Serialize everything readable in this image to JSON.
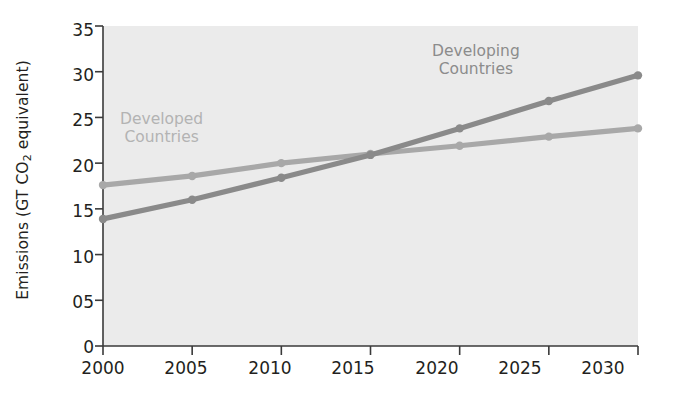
{
  "chart_data": {
    "type": "line",
    "title": "",
    "xlabel": "",
    "ylabel": "Emissions (GT CO2 equivalent)",
    "ylabel_prefix": "Emissions (GT CO",
    "ylabel_sub": "2",
    "ylabel_suffix": " equivalent)",
    "x": [
      2000,
      2005,
      2010,
      2015,
      2020,
      2025,
      2030
    ],
    "categories": [
      "2000",
      "2005",
      "2010",
      "2015",
      "2020",
      "2025",
      "2030"
    ],
    "xlim": [
      2000,
      2030
    ],
    "ylim": [
      0,
      35
    ],
    "yticks": [
      35,
      30,
      25,
      20,
      15,
      10,
      5,
      0
    ],
    "ytick_labels": [
      "35",
      "30",
      "25",
      "20",
      "15",
      "10",
      "05",
      "0"
    ],
    "grid": false,
    "legend_position": "inline-annotations",
    "series": [
      {
        "name": "Developed Countries",
        "values": [
          17.6,
          18.6,
          20.0,
          21.0,
          21.9,
          22.9,
          23.8
        ],
        "color": "#a8a8a8",
        "marker": "circle"
      },
      {
        "name": "Developing Countries",
        "values": [
          13.9,
          16.0,
          18.4,
          20.9,
          23.8,
          26.8,
          29.6
        ],
        "color": "#8a8a8a",
        "marker": "circle"
      }
    ],
    "annotations": [
      {
        "text_line1": "Developed",
        "text_line2": "Countries",
        "color": "#b3b3b3"
      },
      {
        "text_line1": "Developing",
        "text_line2": "Countries",
        "color": "#8c8c8c"
      }
    ],
    "plot_background": "#ebebeb",
    "axis_color": "#3a3a3a"
  }
}
